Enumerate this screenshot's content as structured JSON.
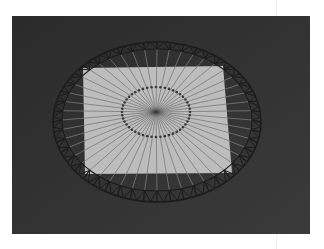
{
  "figure": {
    "spoke_count": 48,
    "colors": {
      "background": "#2e2e2e",
      "plane": "#bdbdbd",
      "wire": "#1c1c1c",
      "spoke_on_plane": "#7a7a7a",
      "hub": "#3a3a3a"
    }
  }
}
